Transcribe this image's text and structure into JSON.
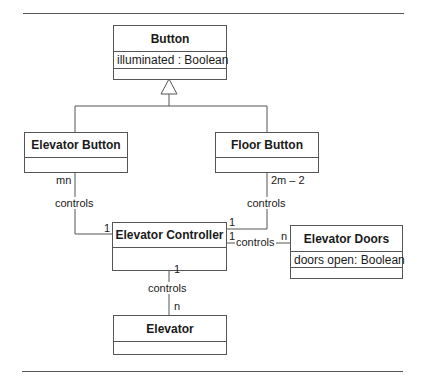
{
  "diagram": {
    "type": "uml-class-diagram",
    "classes": {
      "button": {
        "name": "Button",
        "attributes": [
          "illuminated : Boolean"
        ]
      },
      "elevator_button": {
        "name": "Elevator Button",
        "attributes": []
      },
      "floor_button": {
        "name": "Floor Button",
        "attributes": []
      },
      "elevator_controller": {
        "name": "Elevator Controller",
        "attributes": []
      },
      "elevator_doors": {
        "name": "Elevator Doors",
        "attributes": [
          "doors open: Boolean"
        ]
      },
      "elevator": {
        "name": "Elevator",
        "attributes": []
      }
    },
    "relationships": {
      "generalization": {
        "parent": "Button",
        "children": [
          "Elevator Button",
          "Floor Button"
        ]
      },
      "eb_controller": {
        "label": "controls",
        "mult_source": "mn",
        "mult_target": "1"
      },
      "fb_controller": {
        "label": "controls",
        "mult_source": "2m – 2",
        "mult_target": "1"
      },
      "controller_doors": {
        "label": "controls",
        "mult_source": "1",
        "mult_target": "n"
      },
      "controller_elevator": {
        "label": "controls",
        "mult_source": "1",
        "mult_target": "n"
      }
    }
  }
}
